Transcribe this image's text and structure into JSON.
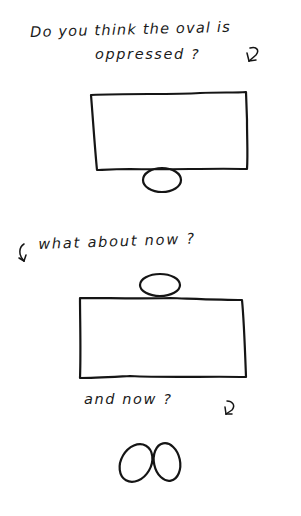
{
  "panel1": {
    "caption_line1": "Do you think the oval is",
    "caption_line2": "oppressed ?",
    "arrow_icon": "curved-down-arrow"
  },
  "panel2": {
    "caption": "what about now ?",
    "arrow_icon": "curved-down-left-arrow"
  },
  "panel3": {
    "caption": "and now ?",
    "arrow_icon": "curved-down-arrow"
  },
  "colors": {
    "ink": "#151515",
    "paper": "#ffffff"
  }
}
